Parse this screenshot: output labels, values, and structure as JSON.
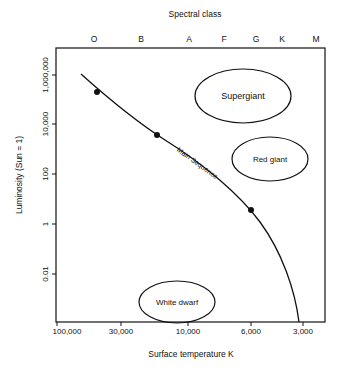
{
  "diagram": {
    "top_axis": {
      "label": "Spectral class",
      "classes": [
        {
          "name": "O",
          "x": 94
        },
        {
          "name": "B",
          "x": 141
        },
        {
          "name": "A",
          "x": 189
        },
        {
          "name": "F",
          "x": 224
        },
        {
          "name": "G",
          "x": 256
        },
        {
          "name": "K",
          "x": 282
        },
        {
          "name": "M",
          "x": 316
        }
      ]
    },
    "y_axis": {
      "label": "Luminosity (Sun = 1)",
      "ticks": [
        {
          "label": "1,000,000",
          "y": 75
        },
        {
          "label": "10,000",
          "y": 124
        },
        {
          "label": "100",
          "y": 174
        },
        {
          "label": "1",
          "y": 224
        },
        {
          "label": "0.01",
          "y": 274
        }
      ]
    },
    "x_axis": {
      "label": "Surface temperature  K",
      "ticks": [
        {
          "label": "100,000",
          "x": 57
        },
        {
          "label": "30,000",
          "x": 121
        },
        {
          "label": "10,000",
          "x": 188
        },
        {
          "label": "6,000",
          "x": 251
        },
        {
          "label": "3,000",
          "x": 303
        }
      ]
    },
    "regions": [
      {
        "name": "Supergiant",
        "cx": 243,
        "cy": 96,
        "rx": 48,
        "ry": 27
      },
      {
        "name": "Red giant",
        "cx": 270,
        "cy": 159,
        "rx": 38,
        "ry": 22
      },
      {
        "name": "White dwarf",
        "cx": 177,
        "cy": 302,
        "rx": 38,
        "ry": 21
      }
    ],
    "main_sequence": {
      "label": "Main Sequence",
      "points": [
        {
          "x": 97,
          "y": 92
        },
        {
          "x": 157,
          "y": 135
        },
        {
          "x": 251,
          "y": 210
        }
      ]
    }
  }
}
